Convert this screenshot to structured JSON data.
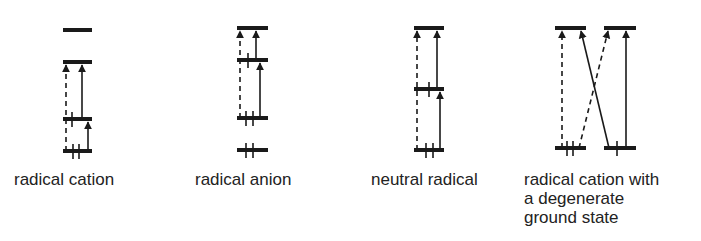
{
  "figure": {
    "colors": {
      "line": "#1a1a1a",
      "text": "#222222",
      "background": "#ffffff"
    },
    "panels": [
      {
        "id": "radical-cation",
        "label": "radical cation",
        "label_pos": [
          14,
          170
        ],
        "levels": [
          {
            "x1": 63,
            "x2": 92,
            "y": 30,
            "electrons": []
          },
          {
            "x1": 63,
            "x2": 92,
            "y": 62,
            "electrons": []
          },
          {
            "x1": 63,
            "x2": 92,
            "y": 119,
            "electrons": [
              72
            ]
          },
          {
            "x1": 63,
            "x2": 92,
            "y": 151,
            "electrons": [
              73,
              79
            ]
          }
        ],
        "transitions": [
          {
            "x1": 66,
            "y1": 151,
            "x2": 66,
            "y2": 63,
            "style": "dashed"
          },
          {
            "x1": 82,
            "y1": 119,
            "x2": 82,
            "y2": 63,
            "style": "solid"
          },
          {
            "x1": 88,
            "y1": 151,
            "x2": 88,
            "y2": 120,
            "style": "solid"
          }
        ]
      },
      {
        "id": "radical-anion",
        "label": "radical anion",
        "label_pos": [
          195,
          170
        ],
        "levels": [
          {
            "x1": 237,
            "x2": 268,
            "y": 28,
            "electrons": []
          },
          {
            "x1": 237,
            "x2": 268,
            "y": 60,
            "electrons": [
              248
            ]
          },
          {
            "x1": 237,
            "x2": 268,
            "y": 118,
            "electrons": [
              246,
              253
            ]
          },
          {
            "x1": 237,
            "x2": 268,
            "y": 150,
            "electrons": [
              246,
              253
            ]
          }
        ],
        "transitions": [
          {
            "x1": 240,
            "y1": 118,
            "x2": 240,
            "y2": 29,
            "style": "dashed"
          },
          {
            "x1": 256,
            "y1": 60,
            "x2": 256,
            "y2": 29,
            "style": "solid"
          },
          {
            "x1": 260,
            "y1": 118,
            "x2": 260,
            "y2": 61,
            "style": "solid"
          }
        ]
      },
      {
        "id": "neutral-radical",
        "label": "neutral radical",
        "label_pos": [
          371,
          170
        ],
        "levels": [
          {
            "x1": 414,
            "x2": 444,
            "y": 28,
            "electrons": []
          },
          {
            "x1": 414,
            "x2": 444,
            "y": 89,
            "electrons": [
              429
            ]
          },
          {
            "x1": 414,
            "x2": 444,
            "y": 150,
            "electrons": [
              426,
              433
            ]
          }
        ],
        "transitions": [
          {
            "x1": 417,
            "y1": 150,
            "x2": 417,
            "y2": 29,
            "style": "dashed"
          },
          {
            "x1": 437,
            "y1": 89,
            "x2": 437,
            "y2": 29,
            "style": "solid"
          },
          {
            "x1": 440,
            "y1": 150,
            "x2": 440,
            "y2": 90,
            "style": "solid"
          }
        ]
      },
      {
        "id": "radical-cation-degenerate",
        "label": "radical cation with\na degenerate\nground state",
        "label_pos": [
          524,
          170
        ],
        "levels": [
          {
            "x1": 555,
            "x2": 586,
            "y": 28,
            "electrons": []
          },
          {
            "x1": 604,
            "x2": 636,
            "y": 28,
            "electrons": []
          },
          {
            "x1": 555,
            "x2": 586,
            "y": 148,
            "electrons": [
              567,
              573
            ]
          },
          {
            "x1": 604,
            "x2": 636,
            "y": 148,
            "electrons": [
              617
            ]
          }
        ],
        "transitions": [
          {
            "x1": 562,
            "y1": 148,
            "x2": 562,
            "y2": 29,
            "style": "dashed"
          },
          {
            "x1": 579,
            "y1": 148,
            "x2": 608,
            "y2": 29,
            "style": "dashed"
          },
          {
            "x1": 609,
            "y1": 148,
            "x2": 581,
            "y2": 29,
            "style": "solid"
          },
          {
            "x1": 626,
            "y1": 148,
            "x2": 626,
            "y2": 29,
            "style": "solid"
          }
        ]
      }
    ]
  }
}
